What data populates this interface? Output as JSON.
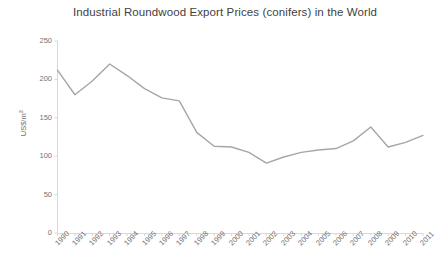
{
  "chart_data": {
    "type": "line",
    "title": "Industrial Roundwood Export Prices (conifers) in the World",
    "title_line1": "Industrial Roundwood Export Prices (conifers) in the",
    "title_line2": "World",
    "xlabel": "",
    "ylabel": "US$/m³",
    "ylabel_base": "US$/m",
    "ylabel_exponent": "3",
    "ylim": [
      0,
      250
    ],
    "yticks": [
      0,
      50,
      100,
      150,
      200,
      250
    ],
    "ytick_labels": [
      "0",
      "50",
      "100",
      "150",
      "200",
      "250"
    ],
    "grid": false,
    "legend": "none",
    "categories": [
      "1990",
      "1991",
      "1992",
      "1993",
      "1994",
      "1995",
      "1996",
      "1997",
      "1998",
      "1999",
      "2000",
      "2001",
      "2002",
      "2003",
      "2004",
      "2005",
      "2006",
      "2007",
      "2008",
      "2009",
      "2010",
      "2011"
    ],
    "values": [
      212,
      180,
      198,
      220,
      205,
      188,
      176,
      172,
      131,
      113,
      112,
      105,
      91,
      99,
      105,
      108,
      110,
      120,
      138,
      112,
      118,
      127
    ],
    "series": [
      {
        "name": "Industrial Roundwood Export Price",
        "color": "#a6a6a6",
        "values": [
          212,
          180,
          198,
          220,
          205,
          188,
          176,
          172,
          131,
          113,
          112,
          105,
          91,
          99,
          105,
          108,
          110,
          120,
          138,
          112,
          118,
          127
        ]
      }
    ],
    "colors": {
      "line": "#a6a6a6",
      "axis": "#d9d9d9",
      "title_text": "#3f3f3f",
      "tick_text": "#737373",
      "background": "#ffffff"
    }
  }
}
